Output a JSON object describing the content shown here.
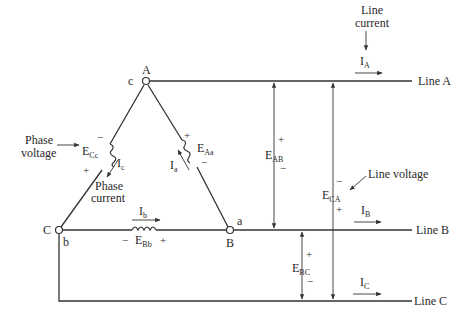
{
  "diagram": {
    "nodes": {
      "A": "A",
      "B": "B",
      "C": "C",
      "a": "a",
      "b": "b",
      "c": "c"
    },
    "lines": {
      "A": "Line A",
      "B": "Line B",
      "C": "Line C"
    },
    "phase_voltages": {
      "Aa": {
        "main": "E",
        "sub": "Aa",
        "plus": "+",
        "minus": "−"
      },
      "Bb": {
        "main": "E",
        "sub": "Bb",
        "plus": "+",
        "minus": "−"
      },
      "Cc": {
        "main": "E",
        "sub": "Cc",
        "plus": "+",
        "minus": "−"
      }
    },
    "phase_currents": {
      "a": {
        "main": "I",
        "sub": "a"
      },
      "b": {
        "main": "I",
        "sub": "b"
      },
      "c": {
        "main": "I",
        "sub": "c"
      }
    },
    "line_currents": {
      "A": {
        "main": "I",
        "sub": "A"
      },
      "B": {
        "main": "I",
        "sub": "B"
      },
      "C": {
        "main": "I",
        "sub": "C"
      }
    },
    "line_voltages": {
      "AB": {
        "main": "E",
        "sub": "AB",
        "plus": "+",
        "minus": "−"
      },
      "CA": {
        "main": "E",
        "sub": "CA",
        "plus": "+",
        "minus": "−"
      },
      "BC": {
        "main": "E",
        "sub": "BC",
        "plus": "+",
        "minus": "−"
      }
    },
    "annotations": {
      "line_current_1": "Line",
      "line_current_2": "current",
      "phase_voltage_1": "Phase",
      "phase_voltage_2": "voltage",
      "phase_current_1": "Phase",
      "phase_current_2": "current",
      "line_voltage": "Line voltage"
    },
    "colors": {
      "ink": "#333333",
      "background": "#ffffff"
    }
  }
}
